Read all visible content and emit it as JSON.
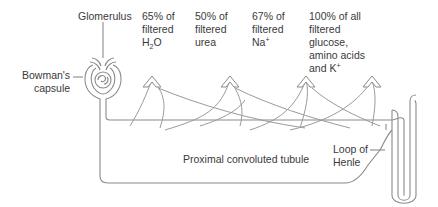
{
  "labels": {
    "glomerulus": "Glomerulus",
    "bowmans_capsule": [
      "Bowman's",
      "capsule"
    ],
    "proximal_tubule": "Proximal convoluted tubule",
    "loop_of_henle": [
      "Loop of",
      "Henle"
    ]
  },
  "reabsorption": [
    {
      "line1": "65% of",
      "line2": "filtered",
      "line3_main": "H",
      "line3_sub": "2",
      "line3_tail": "O"
    },
    {
      "line1": "50% of",
      "line2": "filtered",
      "line3_main": "urea"
    },
    {
      "line1": "67% of",
      "line2": "filtered",
      "line3_main": "Na",
      "line3_sup": "+"
    },
    {
      "line1": "100% of all",
      "line2": "filtered",
      "line3_main": "glucose,",
      "line4": "amino acids",
      "line5_main": "and K",
      "line5_sup": "+"
    }
  ],
  "colors": {
    "line": "#8a8a8a",
    "text": "#3a3a3a"
  }
}
